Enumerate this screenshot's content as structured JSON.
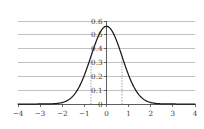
{
  "chart_data": {
    "type": "line",
    "title": "",
    "subtitle": "",
    "xlabel": "",
    "ylabel": "",
    "xlim": [
      -4,
      4
    ],
    "ylim": [
      0,
      0.6
    ],
    "grid": true,
    "grid_axis": "y",
    "legend": null,
    "curve_color": "#1a1a1a",
    "grid_color": "#a6a6a6",
    "axis_color": "#4d4d4d",
    "marker_color": "#8c8c8c",
    "xticks": [
      -4,
      -3,
      -2,
      -1,
      0,
      1,
      2,
      3,
      4
    ],
    "xtick_labels": [
      "−4",
      "−3",
      "−2",
      "−1",
      "0",
      "1",
      "2",
      "3",
      "4"
    ],
    "yticks": [
      0,
      0.1,
      0.2,
      0.3,
      0.4,
      0.5,
      0.6
    ],
    "ytick_labels": [
      "0",
      "0.1",
      "0.2",
      "0.3",
      "0.4",
      "0.5",
      "0.6"
    ],
    "annotations": [
      {
        "name": "left-marker",
        "x": -0.7,
        "y_top": 0.341
      },
      {
        "name": "right-marker",
        "x": 0.7,
        "y_top": 0.341
      }
    ],
    "series": [
      {
        "name": "gaussian-pdf",
        "mean": 0,
        "sigma": 0.71,
        "peak": 0.562,
        "x": [
          -4,
          -3.8,
          -3.6,
          -3.4,
          -3.2,
          -3,
          -2.8,
          -2.6,
          -2.4,
          -2.2,
          -2,
          -1.8,
          -1.6,
          -1.4,
          -1.2,
          -1,
          -0.8,
          -0.6,
          -0.4,
          -0.2,
          0,
          0.2,
          0.4,
          0.6,
          0.8,
          1,
          1.2,
          1.4,
          1.6,
          1.8,
          2,
          2.2,
          2.4,
          2.6,
          2.8,
          3,
          3.2,
          3.4,
          3.6,
          3.8,
          4
        ],
        "values": [
          0.0,
          0.0,
          0.0,
          0.0,
          0.0,
          0.0,
          0.001,
          0.001,
          0.003,
          0.005,
          0.012,
          0.023,
          0.042,
          0.076,
          0.127,
          0.199,
          0.293,
          0.397,
          0.49,
          0.549,
          0.562,
          0.549,
          0.49,
          0.397,
          0.293,
          0.199,
          0.127,
          0.076,
          0.042,
          0.023,
          0.012,
          0.005,
          0.003,
          0.001,
          0.001,
          0.0,
          0.0,
          0.0,
          0.0,
          0.0,
          0.0
        ]
      }
    ]
  }
}
